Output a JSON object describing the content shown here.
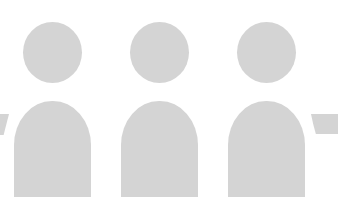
{
  "graphic": {
    "description": "Three generic user silhouette icons",
    "fill_color": "#d4d4d4",
    "background_color": "#ffffff",
    "figures": [
      {
        "name": "person-1",
        "left": 14
      },
      {
        "name": "person-2",
        "left": 121
      },
      {
        "name": "person-3",
        "left": 228
      }
    ],
    "partial_edges": [
      "left-shoulder-fragment",
      "right-shoulder-fragment"
    ]
  }
}
